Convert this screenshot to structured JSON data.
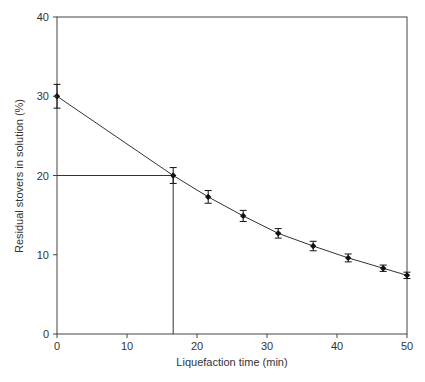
{
  "chart_data": {
    "type": "line",
    "title": "",
    "xlabel": "Liquefaction time (min)",
    "ylabel": "Residual stovers in solution (%)",
    "xlim": [
      0,
      50
    ],
    "ylim": [
      0,
      40
    ],
    "xticks": [
      0,
      10,
      20,
      30,
      40,
      50
    ],
    "yticks": [
      0,
      10,
      20,
      30,
      40
    ],
    "grid": false,
    "legend": null,
    "series": [
      {
        "name": "Residual stovers",
        "x": [
          0,
          16.6,
          21.6,
          26.6,
          31.6,
          36.6,
          41.6,
          46.6,
          50
        ],
        "y": [
          30.0,
          20.0,
          17.3,
          14.9,
          12.7,
          11.1,
          9.6,
          8.3,
          7.4
        ],
        "error": [
          1.5,
          1.0,
          0.8,
          0.7,
          0.6,
          0.6,
          0.5,
          0.4,
          0.4
        ],
        "marker": "diamond",
        "color": "#111111"
      }
    ],
    "annotations": [
      {
        "type": "reference-lines",
        "x": 16.6,
        "y": 20,
        "description": "Vertical and horizontal guide lines marking the point where residual stovers reach 20%"
      }
    ]
  },
  "axes": {
    "x_title": "Liquefaction time (min)",
    "y_title": "Residual stovers in solution (%)",
    "x_tick_labels": [
      "0",
      "10",
      "20",
      "30",
      "40",
      "50"
    ],
    "y_tick_labels": [
      "0",
      "10",
      "20",
      "30",
      "40"
    ]
  },
  "colors": {
    "axis": "#444444",
    "line": "#333333",
    "marker": "#111111",
    "text": "#333333"
  }
}
